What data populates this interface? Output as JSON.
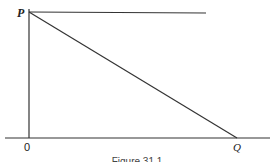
{
  "figure": {
    "labels": {
      "p": "P",
      "q": "Q",
      "origin": "0"
    },
    "caption": "Figure 31.1",
    "colors": {
      "line": "#333333",
      "background": "#ffffff"
    }
  }
}
